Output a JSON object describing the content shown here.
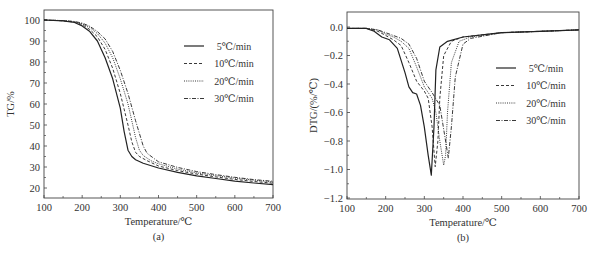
{
  "chart_data": [
    {
      "type": "line",
      "panel_label": "(a)",
      "title": "",
      "xlabel": "Temperature/℃",
      "ylabel": "TG/%",
      "xlim": [
        100,
        700
      ],
      "ylim": [
        15,
        105
      ],
      "xticks": [
        100,
        200,
        300,
        400,
        500,
        600,
        700
      ],
      "yticks": [
        20,
        30,
        40,
        50,
        60,
        70,
        80,
        90,
        100
      ],
      "grid": false,
      "legend_position": "upper right",
      "series": [
        {
          "name": "5℃/min",
          "style": "solid",
          "x": [
            100,
            150,
            180,
            200,
            220,
            240,
            260,
            280,
            300,
            310,
            320,
            330,
            340,
            360,
            400,
            450,
            500,
            550,
            600,
            650,
            700
          ],
          "y": [
            100,
            99.6,
            98.8,
            97.2,
            94.5,
            90,
            82,
            72,
            58,
            47,
            38,
            35,
            33.5,
            31.8,
            29.5,
            27.5,
            25.8,
            24.5,
            23.3,
            22.4,
            21.6
          ]
        },
        {
          "name": "10℃/min",
          "style": "dashed",
          "x": [
            100,
            150,
            180,
            200,
            220,
            240,
            260,
            280,
            300,
            320,
            330,
            340,
            350,
            370,
            400,
            450,
            500,
            550,
            600,
            650,
            700
          ],
          "y": [
            100,
            99.6,
            99,
            97.8,
            95.5,
            92,
            86,
            77,
            65,
            50,
            42,
            37,
            35,
            33,
            30.5,
            28.3,
            26.6,
            25.3,
            24.1,
            23.1,
            22.3
          ]
        },
        {
          "name": "20℃/min",
          "style": "dotted",
          "x": [
            100,
            150,
            180,
            200,
            220,
            240,
            260,
            280,
            300,
            320,
            340,
            350,
            360,
            380,
            400,
            450,
            500,
            550,
            600,
            650,
            700
          ],
          "y": [
            100,
            99.7,
            99.2,
            98.2,
            96.5,
            93.5,
            89,
            82,
            72,
            60,
            44,
            38,
            35.5,
            33,
            31.5,
            29,
            27.2,
            25.9,
            24.7,
            23.7,
            22.8
          ]
        },
        {
          "name": "30℃/min",
          "style": "dashdot",
          "x": [
            100,
            150,
            180,
            200,
            220,
            240,
            260,
            280,
            300,
            320,
            340,
            360,
            370,
            390,
            400,
            450,
            500,
            550,
            600,
            650,
            700
          ],
          "y": [
            100,
            99.7,
            99.3,
            98.5,
            97,
            94.5,
            91,
            85,
            76,
            65,
            52,
            40,
            36.5,
            33.8,
            32.5,
            29.8,
            27.8,
            26.4,
            25.1,
            24,
            23.2
          ]
        }
      ]
    },
    {
      "type": "line",
      "panel_label": "(b)",
      "title": "",
      "xlabel": "Temperature/℃",
      "ylabel": "DTG/(%/℃)",
      "xlim": [
        100,
        700
      ],
      "ylim": [
        -1.2,
        0.1
      ],
      "xticks": [
        100,
        200,
        300,
        400,
        500,
        600,
        700
      ],
      "yticks": [
        0.0,
        -0.2,
        -0.4,
        -0.6,
        -0.8,
        -1.0,
        -1.2
      ],
      "grid": false,
      "legend_position": "center right",
      "series": [
        {
          "name": "5℃/min",
          "style": "solid",
          "x": [
            100,
            150,
            170,
            190,
            210,
            230,
            250,
            260,
            270,
            280,
            290,
            300,
            310,
            318,
            325,
            330,
            340,
            360,
            400,
            500,
            600,
            700
          ],
          "y": [
            -0.01,
            -0.01,
            -0.03,
            -0.07,
            -0.09,
            -0.15,
            -0.32,
            -0.42,
            -0.46,
            -0.47,
            -0.55,
            -0.7,
            -0.9,
            -1.04,
            -0.7,
            -0.3,
            -0.14,
            -0.1,
            -0.07,
            -0.04,
            -0.03,
            -0.02
          ]
        },
        {
          "name": "10℃/min",
          "style": "dashed",
          "x": [
            100,
            150,
            180,
            200,
            220,
            240,
            260,
            280,
            300,
            310,
            320,
            328,
            335,
            340,
            350,
            370,
            400,
            500,
            600,
            700
          ],
          "y": [
            -0.01,
            -0.01,
            -0.03,
            -0.06,
            -0.09,
            -0.13,
            -0.25,
            -0.38,
            -0.45,
            -0.5,
            -0.7,
            -0.98,
            -0.8,
            -0.5,
            -0.2,
            -0.1,
            -0.07,
            -0.04,
            -0.03,
            -0.02
          ]
        },
        {
          "name": "20℃/min",
          "style": "dotted",
          "x": [
            100,
            150,
            180,
            200,
            220,
            240,
            260,
            280,
            300,
            320,
            330,
            340,
            350,
            355,
            360,
            370,
            390,
            420,
            500,
            600,
            700
          ],
          "y": [
            -0.01,
            -0.01,
            -0.02,
            -0.05,
            -0.07,
            -0.1,
            -0.15,
            -0.28,
            -0.42,
            -0.5,
            -0.6,
            -0.8,
            -0.97,
            -0.9,
            -0.6,
            -0.25,
            -0.1,
            -0.07,
            -0.04,
            -0.03,
            -0.02
          ]
        },
        {
          "name": "30℃/min",
          "style": "dashdot",
          "x": [
            100,
            150,
            180,
            200,
            220,
            240,
            260,
            280,
            300,
            320,
            340,
            355,
            362,
            370,
            380,
            400,
            420,
            500,
            600,
            700
          ],
          "y": [
            -0.01,
            -0.01,
            -0.02,
            -0.04,
            -0.06,
            -0.08,
            -0.12,
            -0.22,
            -0.38,
            -0.46,
            -0.55,
            -0.8,
            -0.92,
            -0.7,
            -0.35,
            -0.12,
            -0.08,
            -0.04,
            -0.03,
            -0.02
          ]
        }
      ]
    }
  ]
}
